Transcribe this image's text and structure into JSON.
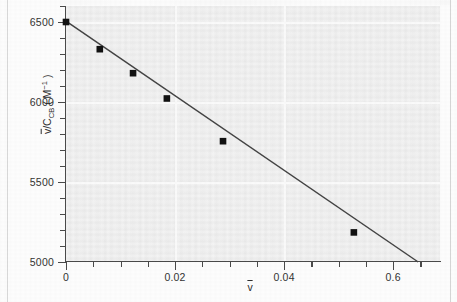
{
  "chart_data": {
    "type": "scatter",
    "title": "",
    "xlabel": "v̄",
    "ylabel": "v̄/C_CB ( M⁻¹ )",
    "xlabel_parts": {
      "symbol": "v",
      "overbar": true
    },
    "ylabel_parts": {
      "numerator": "v",
      "denominator": "C",
      "subscript": "CB",
      "units": "( M",
      "units_sup": "−1",
      "units_close": " )"
    },
    "x": [
      0.0,
      0.0062,
      0.0123,
      0.0185,
      0.0288,
      0.0528
    ],
    "values": [
      6500,
      6330,
      6180,
      6022,
      5755,
      5185
    ],
    "points": [
      {
        "x": 0.0,
        "y": 6500
      },
      {
        "x": 0.0062,
        "y": 6330
      },
      {
        "x": 0.0123,
        "y": 6180
      },
      {
        "x": 0.0185,
        "y": 6022
      },
      {
        "x": 0.0288,
        "y": 5755
      },
      {
        "x": 0.0528,
        "y": 5185
      }
    ],
    "fit_line": {
      "x_start": 0.0,
      "y_start": 6505,
      "x_end": 0.0646,
      "y_end": 5000,
      "slope": -23297,
      "intercept": 6505
    },
    "xlim": [
      0.0,
      0.0686
    ],
    "ylim": [
      5000,
      6600
    ],
    "grid": true,
    "legend": null,
    "marker": "square",
    "marker_color": "#111111",
    "line_color": "#444444",
    "plot_bg_color": "#efefef",
    "gridline_color": "#fbfbfb",
    "axis_color": "#4a4a4a",
    "y_ticks": [
      {
        "value": 5000,
        "label": "5000",
        "major": true
      },
      {
        "value": 5100,
        "label": "",
        "major": false
      },
      {
        "value": 5200,
        "label": "",
        "major": false
      },
      {
        "value": 5300,
        "label": "",
        "major": false
      },
      {
        "value": 5400,
        "label": "",
        "major": false
      },
      {
        "value": 5500,
        "label": "5500",
        "major": true
      },
      {
        "value": 5600,
        "label": "",
        "major": false
      },
      {
        "value": 5700,
        "label": "",
        "major": false
      },
      {
        "value": 5800,
        "label": "",
        "major": false
      },
      {
        "value": 5900,
        "label": "",
        "major": false
      },
      {
        "value": 6000,
        "label": "6000",
        "major": true
      },
      {
        "value": 6100,
        "label": "",
        "major": false
      },
      {
        "value": 6200,
        "label": "",
        "major": false
      },
      {
        "value": 6300,
        "label": "",
        "major": false
      },
      {
        "value": 6400,
        "label": "",
        "major": false
      },
      {
        "value": 6500,
        "label": "6500",
        "major": true
      },
      {
        "value": 6600,
        "label": "",
        "major": false
      }
    ],
    "x_ticks": [
      {
        "value": 0.0,
        "label": "0",
        "major": true
      },
      {
        "value": 0.005,
        "label": "",
        "major": false
      },
      {
        "value": 0.01,
        "label": "",
        "major": false
      },
      {
        "value": 0.015,
        "label": "",
        "major": false
      },
      {
        "value": 0.02,
        "label": "0.02",
        "major": true
      },
      {
        "value": 0.025,
        "label": "",
        "major": false
      },
      {
        "value": 0.03,
        "label": "",
        "major": false
      },
      {
        "value": 0.035,
        "label": "",
        "major": false
      },
      {
        "value": 0.04,
        "label": "0.04",
        "major": true
      },
      {
        "value": 0.045,
        "label": "",
        "major": false
      },
      {
        "value": 0.05,
        "label": "",
        "major": false
      },
      {
        "value": 0.055,
        "label": "",
        "major": false
      },
      {
        "value": 0.06,
        "label": "0.6",
        "major": true
      },
      {
        "value": 0.065,
        "label": "",
        "major": false
      }
    ],
    "y_gridlines": [
      5500,
      6000,
      6500
    ],
    "x_gridlines": [
      0.02,
      0.04
    ]
  }
}
